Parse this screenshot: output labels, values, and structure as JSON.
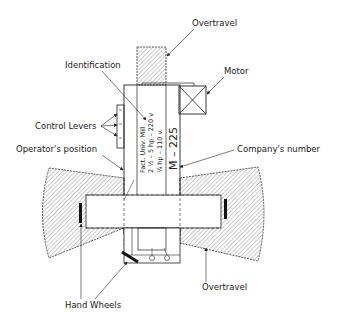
{
  "diagram": {
    "type": "machine-layout-plan",
    "labels": {
      "overtravel_top": "Overtravel",
      "motor": "Motor",
      "identification": "Identification",
      "control_levers": "Control Levers",
      "operators_position": "Operator's position",
      "companys_number": "Company's number",
      "hand_wheels": "Hand Wheels",
      "overtravel_bottom": "Overtravel"
    },
    "nameplate": {
      "line1": "Fact. Univ. Mill",
      "line2": "2 ½ – 5 hp – 220 v",
      "line3": "¼ hp – 110 v",
      "number": "M – 225"
    },
    "colors": {
      "line": "#222222",
      "hatch": "#555555",
      "background": "#ffffff"
    }
  }
}
